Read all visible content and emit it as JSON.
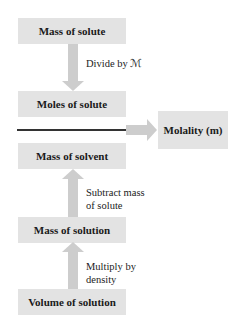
{
  "diagram": {
    "type": "flowchart",
    "nodes": {
      "mass_of_solute": "Mass of solute",
      "moles_of_solute": "Moles of solute",
      "mass_of_solvent": "Mass of solvent",
      "mass_of_solution": "Mass of solution",
      "volume_of_solution": "Volume of solution",
      "molality": "Molality (m)"
    },
    "edges": {
      "divide_by_molar_mass": "Divide by ℳ",
      "subtract_mass_line1": "Subtract mass",
      "subtract_mass_line2": "of solute",
      "multiply_density_line1": "Multiply by",
      "multiply_density_line2": "density"
    },
    "colors": {
      "box_fill": "#e3e3e3",
      "arrow_fill": "#cdcdcd",
      "divider_line": "#333333"
    }
  }
}
